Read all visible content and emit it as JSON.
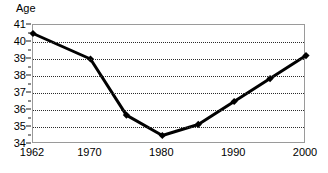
{
  "chart_data": {
    "type": "line",
    "title": "",
    "subtitle": "",
    "xlabel": "",
    "ylabel": "Age",
    "ylim": [
      34,
      41
    ],
    "xlim": [
      1962,
      2000
    ],
    "grid": true,
    "legend": false,
    "legend_position": "none",
    "marker": "diamond",
    "line_color": "#000000",
    "marker_color": "#000000",
    "grid_color": "#2b2b2b",
    "frame_color": "#9a9a9a",
    "background_color": "#ffffff",
    "x": [
      1962,
      1970,
      1975,
      1980,
      1985,
      1990,
      1995,
      2000
    ],
    "values": [
      40.5,
      39.0,
      35.7,
      34.5,
      35.15,
      36.5,
      37.85,
      39.2
    ],
    "series": [
      {
        "name": "Age",
        "values": [
          40.5,
          39.0,
          35.7,
          34.5,
          35.15,
          36.5,
          37.85,
          39.2
        ]
      }
    ],
    "y_ticks": [
      34,
      35,
      36,
      37,
      38,
      39,
      40,
      41
    ],
    "y_tick_labels": [
      "34",
      "35",
      "36",
      "37",
      "38",
      "39",
      "40",
      "41"
    ],
    "x_ticks": [
      1962,
      1970,
      1980,
      1990,
      2000
    ],
    "x_tick_labels": [
      "1962",
      "1970",
      "1980",
      "1990",
      "2000"
    ],
    "annotations": []
  }
}
